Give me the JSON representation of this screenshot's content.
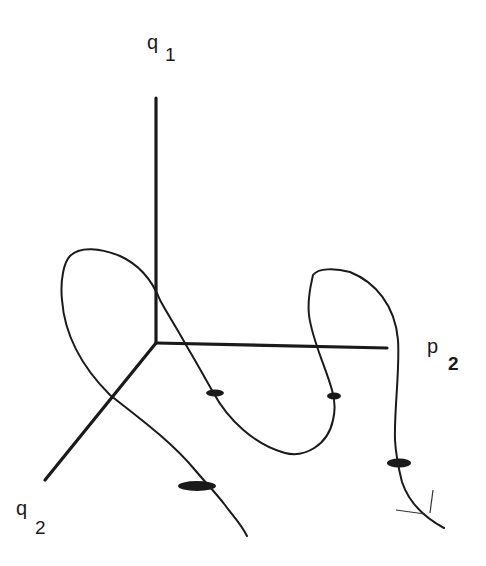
{
  "diagram": {
    "type": "3d-axes-trajectory",
    "axes": [
      {
        "id": "q1",
        "symbol": "q",
        "subscript": "1",
        "direction": "up"
      },
      {
        "id": "p2",
        "symbol": "p",
        "subscript": "2",
        "direction": "right"
      },
      {
        "id": "q2",
        "symbol": "q",
        "subscript": "2",
        "direction": "down-left"
      }
    ],
    "curve": {
      "description": "smooth trajectory winding around the axes with four elliptical markers",
      "markers": 4
    },
    "colors": {
      "ink": "#1a1a1a",
      "background": "#ffffff"
    }
  },
  "labels": {
    "q1": {
      "main": "q",
      "sub": "1"
    },
    "p2": {
      "main": "p",
      "sub": "2"
    },
    "q2": {
      "main": "q",
      "sub": "2"
    }
  }
}
